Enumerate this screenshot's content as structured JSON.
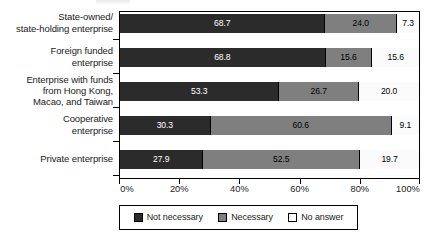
{
  "chart_data": {
    "type": "bar",
    "orientation": "horizontal",
    "stacked": true,
    "normalized_percent": true,
    "title": "",
    "subtitle": "",
    "xlabel": "",
    "ylabel": "",
    "xlim": [
      0,
      100
    ],
    "grid": false,
    "legend_position": "bottom",
    "categories": [
      "State-owned/\nstate-holding enterprise",
      "Foreign funded\nenterprise",
      "Enterprise with funds\nfrom Hong Kong,\nMacao, and Taiwan",
      "Cooperative\nenterprise",
      "Private enterprise"
    ],
    "category_lines": [
      [
        "State-owned/",
        "state-holding enterprise"
      ],
      [
        "Foreign funded",
        "enterprise"
      ],
      [
        "Enterprise with funds",
        "from Hong Kong,",
        "Macao, and Taiwan"
      ],
      [
        "Cooperative",
        "enterprise"
      ],
      [
        "Private enterprise"
      ]
    ],
    "series": [
      {
        "name": "Not necessary",
        "color": "#2b2b2b",
        "values": [
          68.7,
          68.8,
          53.3,
          30.3,
          27.9
        ],
        "labels": [
          "68.7",
          "68.8",
          "53.3",
          "30.3",
          "27.9"
        ]
      },
      {
        "name": "Necessary",
        "color": "#7f7f7f",
        "values": [
          24.0,
          15.6,
          26.7,
          60.6,
          52.5
        ],
        "labels": [
          "24.0",
          "15.6",
          "26.7",
          "60.6",
          "52.5"
        ]
      },
      {
        "name": "No answer",
        "color": "#ffffff",
        "values": [
          7.3,
          15.6,
          20.0,
          9.1,
          19.7
        ],
        "labels": [
          "7.3",
          "15.6",
          "20.0",
          "9.1",
          "19.7"
        ]
      }
    ],
    "xticks": [
      0,
      20,
      40,
      60,
      80,
      100
    ],
    "xtick_labels": [
      "0%",
      "20%",
      "40%",
      "60%",
      "80%",
      "100%"
    ],
    "legend": [
      {
        "label": "Not necessary",
        "color": "#2b2b2b",
        "swatch": "filled-dark"
      },
      {
        "label": "Necessary",
        "color": "#7f7f7f",
        "swatch": "filled-gray"
      },
      {
        "label": "No answer",
        "color": "#ffffff",
        "swatch": "outline-white"
      }
    ]
  }
}
